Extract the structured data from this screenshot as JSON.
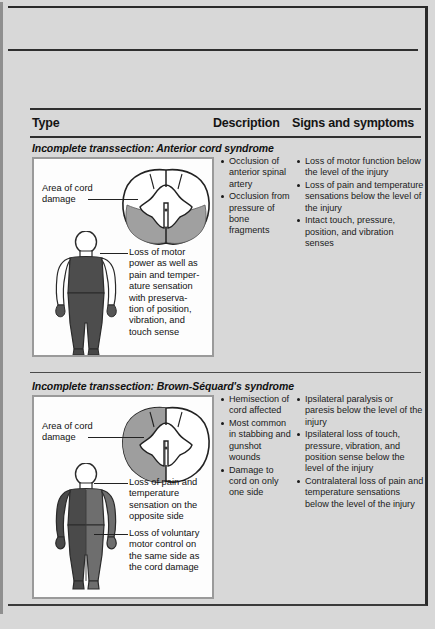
{
  "document": {
    "columns": [
      {
        "key": "type",
        "label": "Type"
      },
      {
        "key": "desc",
        "label": "Description"
      },
      {
        "key": "signs",
        "label": "Signs and symptoms"
      }
    ],
    "sections": [
      {
        "title": "Incomplete transsection: Anterior cord syndrome",
        "figure": {
          "cord_label": "Area of cord\ndamage",
          "cord_label_line1": "Area of cord",
          "cord_label_line2": "damage",
          "body_label": "Loss of motor power as well as pain and temperature sensation with preservation of position, vibration, and touch sense",
          "body_label_lines": [
            "Loss of motor",
            "power as well as",
            "pain and temper-",
            "ature sensation",
            "with preserva-",
            "tion of position,",
            "vibration, and",
            "touch sense"
          ],
          "cord_shading": "anterior",
          "body_shading": "full-torso-legs"
        },
        "description": [
          "Occlusion of anterior spinal artery",
          "Occlusion from pressure of bone fragments"
        ],
        "signs": [
          "Loss of motor function below the level of the injury",
          "Loss of pain and temperature sensations below the level of the injury",
          "Intact touch, pressure, position, and vibration senses"
        ]
      },
      {
        "title": "Incomplete transsection: Brown-Séquard's syndrome",
        "figure": {
          "cord_label_line1": "Area of cord",
          "cord_label_line2": "damage",
          "body_label_a_lines": [
            "Loss of pain and",
            "temperature",
            "sensation on the",
            "opposite side"
          ],
          "body_label_b_lines": [
            "Loss of voluntary",
            "motor control on",
            "the same side as",
            "the cord damage"
          ],
          "cord_shading": "left-hemisection",
          "body_shading": "split-vertical"
        },
        "description": [
          "Hemisection of cord affected",
          "Most common in stabbing and gunshot wounds",
          "Damage to cord on only one side"
        ],
        "signs": [
          "Ipsilateral paralysis or paresis below the level of the injury",
          "Ipsilateral loss of touch, pressure, vibration, and position sense below the level of the injury",
          "Contralateral loss of pain and temperature sensations below the level of the injury"
        ]
      }
    ],
    "colors": {
      "page_background": "#d8d8d8",
      "panel_background": "#fdfdfd",
      "rule": "#2f2f2f",
      "text": "#141414",
      "cord_shade": "#9e9e9e",
      "body_shade_dark": "#4a4a4a",
      "body_shade_mid": "#6e6e6e",
      "body_outline": "#2a2a2a"
    }
  }
}
